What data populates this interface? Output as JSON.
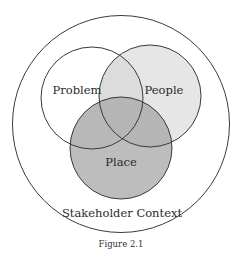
{
  "diagram": {
    "type": "venn",
    "outer": {
      "label": "Stakeholder Context",
      "fill": "#ffffff",
      "stroke": "#3a3a3a"
    },
    "sets": [
      {
        "id": "problem",
        "label": "Problem",
        "fill": "#ffffff"
      },
      {
        "id": "people",
        "label": "People",
        "fill": "#e6e6e6"
      },
      {
        "id": "place",
        "label": "Place",
        "fill": "#bdbdbd"
      }
    ],
    "stroke_color": "#3a3a3a"
  },
  "caption": "Figure 2.1"
}
